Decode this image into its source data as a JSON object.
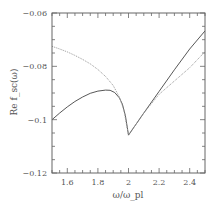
{
  "chart_data": {
    "type": "line",
    "title": "",
    "xlabel": "ω/ω_pl",
    "ylabel": "Re f_sc(ω)",
    "xlim": [
      1.5,
      2.5
    ],
    "ylim": [
      -0.12,
      -0.06
    ],
    "xticks": [
      1.6,
      1.8,
      2.0,
      2.2,
      2.4
    ],
    "xtick_labels": [
      "1.6",
      "1.8",
      "2",
      "2.2",
      "2.4"
    ],
    "yticks": [
      -0.12,
      -0.1,
      -0.08,
      -0.06
    ],
    "ytick_labels": [
      "-0.12",
      "-0.1",
      "-0.08",
      "-0.06"
    ],
    "grid": false,
    "legend": null,
    "series": [
      {
        "name": "solid",
        "style": "solid",
        "color": "#444444",
        "x": [
          1.5,
          1.55,
          1.6,
          1.65,
          1.7,
          1.75,
          1.8,
          1.85,
          1.88,
          1.91,
          1.94,
          1.96,
          1.98,
          2.0,
          2.1,
          2.2,
          2.3,
          2.4,
          2.5
        ],
        "y": [
          -0.1,
          -0.0975,
          -0.0952,
          -0.0932,
          -0.0915,
          -0.0901,
          -0.0893,
          -0.0889,
          -0.089,
          -0.0898,
          -0.0918,
          -0.0942,
          -0.0985,
          -0.1058,
          -0.0975,
          -0.0894,
          -0.0813,
          -0.0735,
          -0.0667
        ]
      },
      {
        "name": "dotted",
        "style": "dotted",
        "color": "#999999",
        "x": [
          1.5,
          1.55,
          1.6,
          1.65,
          1.7,
          1.75,
          1.8,
          1.85,
          1.9,
          1.94,
          1.97,
          2.0,
          2.1,
          2.2,
          2.3,
          2.4,
          2.5
        ],
        "y": [
          -0.0725,
          -0.0735,
          -0.0746,
          -0.0759,
          -0.0774,
          -0.0791,
          -0.0812,
          -0.0838,
          -0.0872,
          -0.0915,
          -0.0965,
          -0.1058,
          -0.0975,
          -0.0905,
          -0.0855,
          -0.0805,
          -0.0745
        ]
      }
    ]
  }
}
